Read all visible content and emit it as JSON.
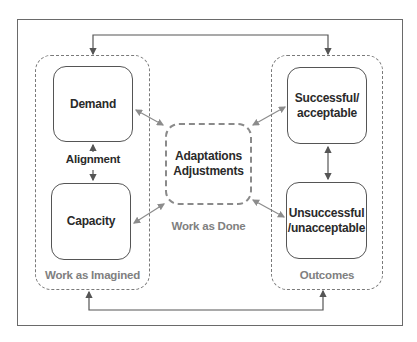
{
  "diagram": {
    "groups": {
      "imagined": {
        "label": "Work as Imagined"
      },
      "done": {
        "label": "Work as Done"
      },
      "outcomes": {
        "label": "Outcomes"
      }
    },
    "nodes": {
      "demand": "Demand",
      "capacity": "Capacity",
      "alignment": "Alignment",
      "adaptations_line1": "Adaptations",
      "adaptations_line2": "Adjustments",
      "successful_line1": "Successful/",
      "successful_line2": "acceptable",
      "unsuccessful_line1": "Unsuccessful",
      "unsuccessful_line2": "/unacceptable"
    },
    "colors": {
      "frame": "#6a6a6a",
      "dashed": "#7a7a7a",
      "box_border": "#555555",
      "text_dark": "#2a2a2a",
      "text_gray": "#808080",
      "arrow_gray": "#8c8c8c"
    }
  }
}
